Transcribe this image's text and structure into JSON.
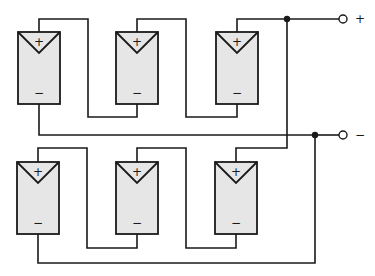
{
  "diagram": {
    "type": "solar-array-wiring",
    "strings": [
      {
        "name": "string-1",
        "modules": [
          {
            "plus": "+",
            "minus": "−"
          },
          {
            "plus": "+",
            "minus": "−"
          },
          {
            "plus": "+",
            "minus": "−"
          }
        ]
      },
      {
        "name": "string-2",
        "modules": [
          {
            "plus": "+",
            "minus": "−"
          },
          {
            "plus": "+",
            "minus": "−"
          },
          {
            "plus": "+",
            "minus": "−"
          }
        ]
      }
    ],
    "terminals": {
      "positive": "+",
      "negative": "−"
    },
    "colors": {
      "line": "#1a1a1a",
      "panel_fill": "#e6e6e6",
      "background": "#ffffff"
    }
  }
}
